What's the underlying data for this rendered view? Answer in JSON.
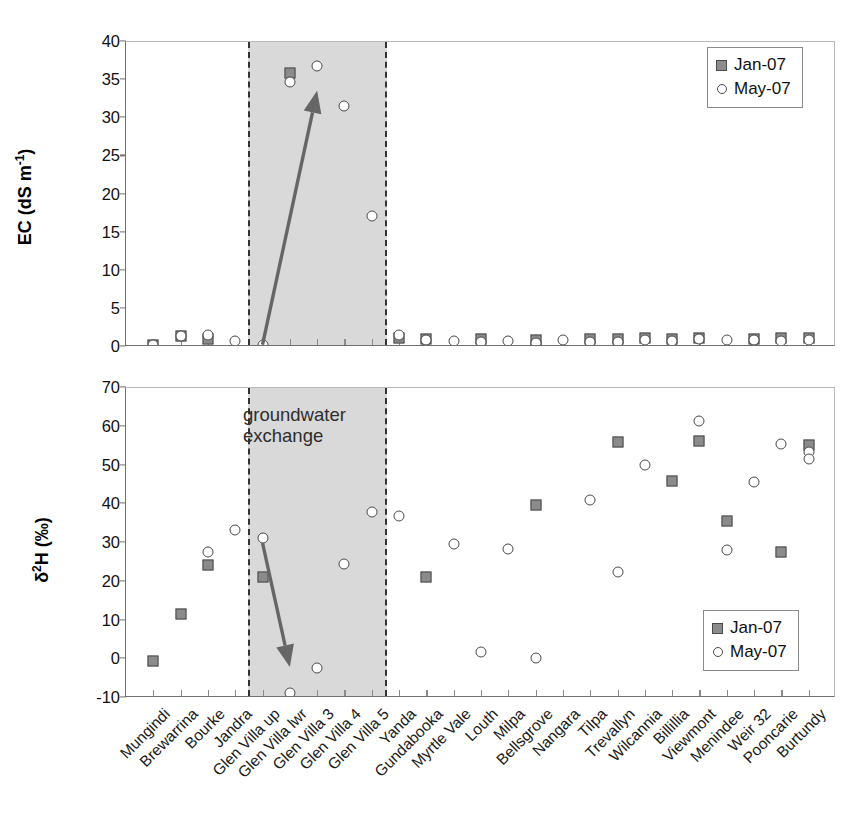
{
  "figure": {
    "annotation": "groundwater\nexchange",
    "annotation_line1": "groundwater",
    "annotation_line2": "exchange"
  },
  "legend": {
    "entries": [
      {
        "label": "Jan-07",
        "marker": "filled-square-icon",
        "color": "#8b8b8b"
      },
      {
        "label": "May-07",
        "marker": "open-circle-icon",
        "color": "#ffffff"
      }
    ]
  },
  "categories": [
    "Mungindi",
    "Brewarrina",
    "Bourke",
    "Jandra",
    "Glen Villa up",
    "Glen Villa lwr",
    "Glen Villa 3",
    "Glen Villa 4",
    "Glen Villa 5",
    "Yanda",
    "Gundabooka",
    "Myrtle Vale",
    "Louth",
    "Milpa",
    "Bellsgrove",
    "Nangara",
    "Tilpa",
    "Trevallyn",
    "Wilcannia",
    "Billillia",
    "Viewmont",
    "Menindee",
    "Weir 32",
    "Pooncarie",
    "Burtundy"
  ],
  "shaded_region": {
    "label": "groundwater exchange",
    "from_category": "Glen Villa up",
    "to_category": "Glen Villa 5",
    "start_index": 4,
    "end_index": 8,
    "fill": "#d9d9d9"
  },
  "chart_data": [
    {
      "type": "scatter",
      "panel": "upper",
      "title": "",
      "xlabel": "",
      "ylabel": "EC (dS m-1)",
      "ylabel_html": "EC (dS m⁻¹)",
      "ylim": [
        0,
        40
      ],
      "yticks": [
        0,
        5,
        10,
        15,
        20,
        25,
        30,
        35,
        40
      ],
      "grid": false,
      "legend_position": "top-right",
      "categories": [
        "Mungindi",
        "Brewarrina",
        "Bourke",
        "Jandra",
        "Glen Villa up",
        "Glen Villa lwr",
        "Glen Villa 3",
        "Glen Villa 4",
        "Glen Villa 5",
        "Yanda",
        "Gundabooka",
        "Myrtle Vale",
        "Louth",
        "Milpa",
        "Bellsgrove",
        "Nangara",
        "Tilpa",
        "Trevallyn",
        "Wilcannia",
        "Billillia",
        "Viewmont",
        "Menindee",
        "Weir 32",
        "Pooncarie",
        "Burtundy"
      ],
      "series": [
        {
          "name": "Jan-07",
          "marker": "filled-square",
          "values": [
            0.3,
            1.4,
            1.0,
            null,
            null,
            36.0,
            null,
            null,
            null,
            1.2,
            1.1,
            null,
            1.1,
            null,
            0.9,
            null,
            1.0,
            1.0,
            1.2,
            1.1,
            1.2,
            null,
            1.1,
            1.2,
            1.2
          ]
        },
        {
          "name": "May-07",
          "marker": "open-circle",
          "values": [
            0.3,
            1.4,
            1.6,
            0.8,
            0.2,
            34.7,
            36.8,
            31.6,
            17.2,
            1.6,
            0.9,
            0.8,
            0.7,
            0.8,
            0.5,
            0.9,
            0.6,
            0.7,
            0.9,
            0.8,
            1.1,
            0.9,
            0.9,
            0.8,
            0.9
          ]
        }
      ]
    },
    {
      "type": "scatter",
      "panel": "lower",
      "title": "",
      "xlabel": "",
      "ylabel": "d2H (per mil)",
      "ylabel_html": "δ²H (‰)",
      "ylim": [
        -10,
        70
      ],
      "yticks": [
        -10,
        0,
        10,
        20,
        30,
        40,
        50,
        60,
        70
      ],
      "grid": false,
      "legend_position": "bottom-right",
      "annotation": "groundwater exchange",
      "categories": [
        "Mungindi",
        "Brewarrina",
        "Bourke",
        "Jandra",
        "Glen Villa up",
        "Glen Villa lwr",
        "Glen Villa 3",
        "Glen Villa 4",
        "Glen Villa 5",
        "Yanda",
        "Gundabooka",
        "Myrtle Vale",
        "Louth",
        "Milpa",
        "Bellsgrove",
        "Nangara",
        "Tilpa",
        "Trevallyn",
        "Wilcannia",
        "Billillia",
        "Viewmont",
        "Menindee",
        "Weir 32",
        "Pooncarie",
        "Burtundy"
      ],
      "series": [
        {
          "name": "Jan-07",
          "marker": "filled-square",
          "values": [
            -0.5,
            11.7,
            24.2,
            null,
            21.2,
            null,
            null,
            null,
            null,
            null,
            21.1,
            null,
            null,
            null,
            39.8,
            null,
            null,
            56.1,
            null,
            46.0,
            56.2,
            35.6,
            null,
            27.7,
            55.2
          ]
        },
        {
          "name": "May-07",
          "marker": "open-circle",
          "values": [
            null,
            null,
            27.8,
            33.4,
            31.3,
            -8.7,
            -2.3,
            24.6,
            37.9,
            36.9,
            null,
            29.7,
            1.8,
            28.4,
            0.4,
            null,
            41.1,
            22.6,
            50.1,
            null,
            61.4,
            28.2,
            45.7,
            55.6,
            53.6
          ]
        }
      ],
      "extra_points": [
        {
          "series": "May-07",
          "category": "Burtundy",
          "value": 51.6
        }
      ]
    }
  ],
  "arrows": [
    {
      "name": "increase-arrow",
      "panel": "upper",
      "direction": "up-right",
      "color": "#666666",
      "from": {
        "category_index": 4,
        "value": 0.3
      },
      "to": {
        "category_index": 6,
        "value": 33.6
      }
    },
    {
      "name": "decrease-arrow",
      "panel": "lower",
      "direction": "down-right",
      "color": "#666666",
      "from": {
        "category_index": 4,
        "value": 30.0
      },
      "to": {
        "category_index": 5,
        "value": -2.0
      }
    }
  ]
}
